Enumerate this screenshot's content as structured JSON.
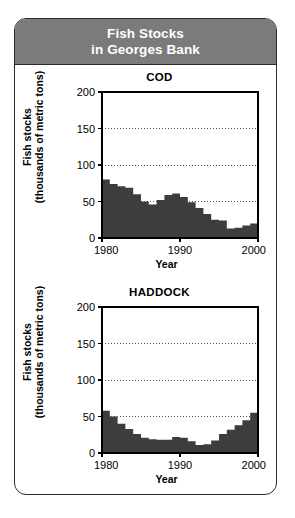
{
  "header": {
    "line1": "Fish Stocks",
    "line2": "in Georges Bank",
    "bg_color": "#7b7b7b",
    "text_color": "#ffffff"
  },
  "colors": {
    "fill": "#3d3d3d",
    "axis": "#000000",
    "grid": "#555555",
    "card_border": "#2b2b2b",
    "page_bg": "#ffffff"
  },
  "chart_data": [
    {
      "type": "area",
      "title": "COD",
      "xlabel": "Year",
      "ylabel": "Fish stocks\n(thousands of metric tons)",
      "ylim": [
        0,
        200
      ],
      "xlim": [
        1980,
        2000
      ],
      "yticks": [
        0,
        50,
        100,
        150,
        200
      ],
      "xticks": [
        1980,
        1990,
        2000
      ],
      "xticklabels": [
        "1980",
        "1990",
        "2000"
      ],
      "yticklabels": [
        "0",
        "50",
        "100",
        "150",
        "200"
      ],
      "gridlines": [
        50,
        100,
        150
      ],
      "grid": true,
      "legend": "none",
      "x": [
        1980,
        1981,
        1982,
        1983,
        1984,
        1985,
        1986,
        1987,
        1988,
        1989,
        1990,
        1991,
        1992,
        1993,
        1994,
        1995,
        1996,
        1997,
        1998,
        1999,
        2000
      ],
      "values": [
        80,
        74,
        71,
        69,
        60,
        50,
        46,
        52,
        59,
        61,
        56,
        49,
        41,
        33,
        25,
        24,
        13,
        14,
        17,
        20,
        24
      ]
    },
    {
      "type": "area",
      "title": "HADDOCK",
      "xlabel": "Year",
      "ylabel": "Fish stocks\n(thousands of metric tons)",
      "ylim": [
        0,
        200
      ],
      "xlim": [
        1980,
        2000
      ],
      "yticks": [
        0,
        50,
        100,
        150,
        200
      ],
      "xticks": [
        1980,
        1990,
        2000
      ],
      "xticklabels": [
        "1980",
        "1990",
        "2000"
      ],
      "yticklabels": [
        "0",
        "50",
        "100",
        "150",
        "200"
      ],
      "gridlines": [
        50,
        100,
        150
      ],
      "grid": true,
      "legend": "none",
      "x": [
        1980,
        1981,
        1982,
        1983,
        1984,
        1985,
        1986,
        1987,
        1988,
        1989,
        1990,
        1991,
        1992,
        1993,
        1994,
        1995,
        1996,
        1997,
        1998,
        1999,
        2000
      ],
      "values": [
        58,
        50,
        40,
        33,
        26,
        21,
        19,
        18,
        18,
        22,
        21,
        16,
        11,
        12,
        17,
        26,
        32,
        38,
        45,
        55,
        62
      ]
    }
  ]
}
